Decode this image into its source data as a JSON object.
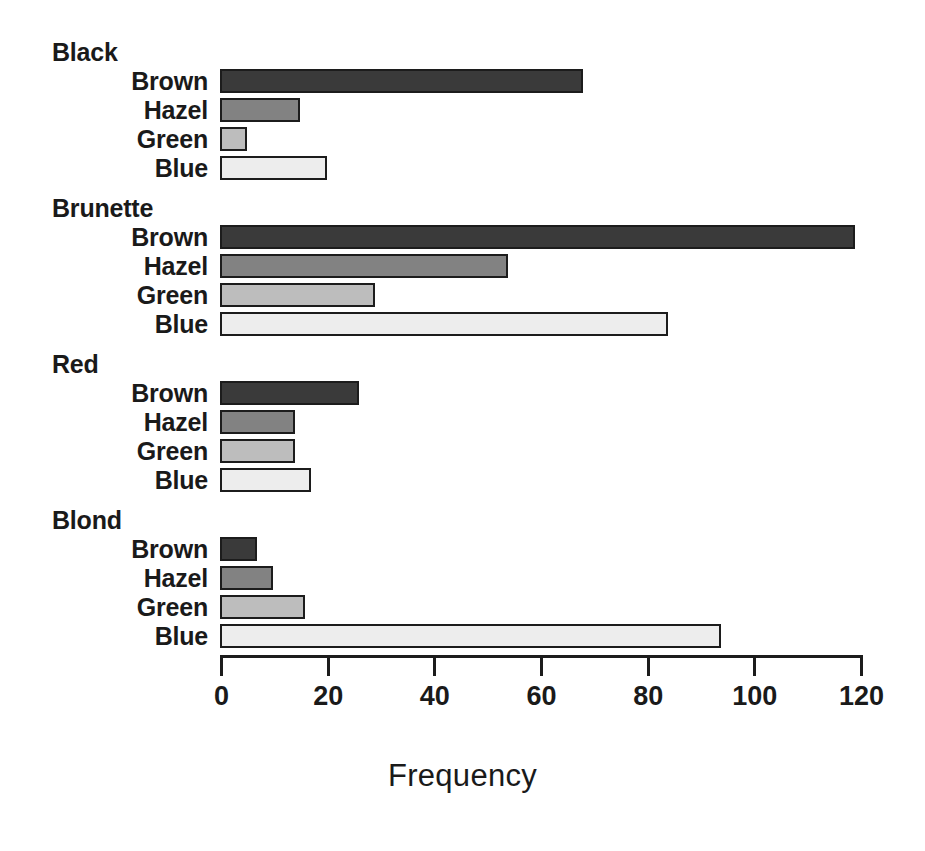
{
  "chart_data": {
    "type": "bar",
    "orientation": "horizontal",
    "title": "",
    "subtitle": "",
    "xlabel": "Frequency",
    "ylabel": "",
    "xlim": [
      0,
      120
    ],
    "xticks": [
      0,
      20,
      40,
      60,
      80,
      100,
      120
    ],
    "xtick_labels": [
      "0",
      "20",
      "40",
      "60",
      "80",
      "100",
      "120"
    ],
    "grid": false,
    "legend": "none",
    "group_label_name": "Hair",
    "categories": [
      "Brown",
      "Hazel",
      "Green",
      "Blue"
    ],
    "groups": [
      {
        "label": "Black",
        "categories": [
          "Brown",
          "Hazel",
          "Green",
          "Blue"
        ],
        "values": [
          68,
          15,
          5,
          20
        ]
      },
      {
        "label": "Brunette",
        "categories": [
          "Brown",
          "Hazel",
          "Green",
          "Blue"
        ],
        "values": [
          119,
          54,
          29,
          84
        ]
      },
      {
        "label": "Red",
        "categories": [
          "Brown",
          "Hazel",
          "Green",
          "Blue"
        ],
        "values": [
          26,
          14,
          14,
          17
        ]
      },
      {
        "label": "Blond",
        "categories": [
          "Brown",
          "Hazel",
          "Green",
          "Blue"
        ],
        "values": [
          7,
          10,
          16,
          94
        ]
      }
    ],
    "series": [
      {
        "name": "Brown",
        "values": [
          68,
          119,
          26,
          7
        ]
      },
      {
        "name": "Hazel",
        "values": [
          15,
          54,
          14,
          10
        ]
      },
      {
        "name": "Green",
        "values": [
          5,
          29,
          14,
          16
        ]
      },
      {
        "name": "Blue",
        "values": [
          20,
          84,
          17,
          94
        ]
      }
    ]
  },
  "style": {
    "fill_brown": "#3a3a3a",
    "fill_hazel": "#828282",
    "fill_green": "#bdbdbd",
    "fill_blue": "#ededed",
    "bar_outline": "#1c1c1c",
    "axis_color": "#1c1c1c",
    "text_color": "#1a1a1a",
    "background": "#ffffff"
  },
  "geometry": {
    "x_zero_px": 220,
    "x_max_px": 860,
    "px_per_unit": 5.3333,
    "group_tops": [
      40,
      196,
      352,
      508
    ],
    "row_height": 29,
    "first_row_offset": 26,
    "axis_top": 655
  }
}
